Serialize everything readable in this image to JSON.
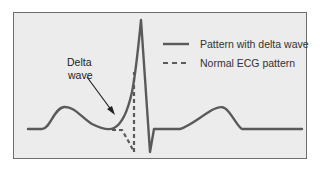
{
  "diagram": {
    "annotation": {
      "line1": "Delta",
      "line2": "wave"
    },
    "legend": [
      {
        "label": "Pattern with delta wave",
        "style": "solid"
      },
      {
        "label": "Normal ECG pattern",
        "style": "dashed"
      }
    ],
    "colors": {
      "waveform": "#5a5a5a",
      "background": "#ececec",
      "frame": "#6e6e6e",
      "text": "#222222",
      "arrow": "#222222"
    }
  }
}
